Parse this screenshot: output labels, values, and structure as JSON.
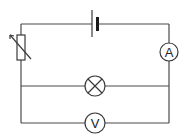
{
  "diagram": {
    "type": "circuit",
    "components": {
      "battery": {
        "name": "cell"
      },
      "rheostat": {
        "name": "variable-resistor"
      },
      "ammeter": {
        "label": "A"
      },
      "lamp": {
        "name": "lamp"
      },
      "voltmeter": {
        "label": "V"
      }
    },
    "colors": {
      "line": "#3a3a3a",
      "background": "#ffffff"
    }
  }
}
